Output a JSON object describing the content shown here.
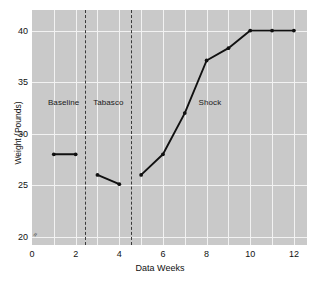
{
  "chart_data": {
    "type": "line",
    "title": "",
    "xlabel": "Data Weeks",
    "ylabel": "Weight (Pounds)",
    "xlim": [
      0,
      12.6
    ],
    "ylim": [
      19.2,
      42.0
    ],
    "xticks": [
      0,
      2,
      4,
      6,
      8,
      10,
      12
    ],
    "xtick_labels": [
      "0",
      "2",
      "4",
      "6",
      "8",
      "10",
      "12"
    ],
    "yticks": [
      20,
      25,
      30,
      35,
      40
    ],
    "ytick_labels": [
      "20",
      "25",
      "30",
      "35",
      "40"
    ],
    "grid": true,
    "grid_color": "#f2f2f2",
    "plot_bgcolor": "#c9c9c9",
    "line_color": "#111111",
    "marker_color": "#111111",
    "legend": "none",
    "axis_break_marker": "≈",
    "series": [
      {
        "name": "Baseline",
        "x": [
          1,
          2
        ],
        "values": [
          28.0,
          28.0
        ]
      },
      {
        "name": "Tabasco",
        "x": [
          3,
          4
        ],
        "values": [
          26.0,
          25.1
        ]
      },
      {
        "name": "Shock",
        "x": [
          5,
          6,
          7,
          8,
          9,
          10,
          11,
          12
        ],
        "values": [
          26.0,
          28.0,
          32.0,
          37.1,
          38.3,
          40.0,
          40.0,
          40.0
        ]
      }
    ],
    "phase_dividers": [
      2.45,
      4.55
    ],
    "annotations": [
      {
        "label": "Baseline",
        "x": 1.45,
        "y": 33.0
      },
      {
        "label": "Tabasco",
        "x": 3.5,
        "y": 33.0
      },
      {
        "label": "Shock",
        "x": 8.15,
        "y": 33.0
      }
    ]
  }
}
